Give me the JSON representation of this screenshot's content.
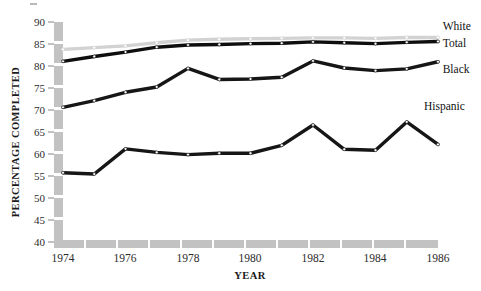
{
  "chart_data": {
    "type": "line",
    "title": "",
    "xlabel": "YEAR",
    "ylabel": "PERCENTAGE COMPLETED",
    "x": [
      1974,
      1975,
      1976,
      1977,
      1978,
      1979,
      1980,
      1981,
      1982,
      1983,
      1984,
      1985,
      1986
    ],
    "xlim": [
      1974,
      1986
    ],
    "ylim": [
      40,
      90
    ],
    "xticks": [
      1974,
      1976,
      1978,
      1980,
      1982,
      1984,
      1986
    ],
    "xtick_labels": [
      "1974",
      "1976",
      "1978",
      "1980",
      "1982",
      "1984",
      "1986"
    ],
    "yticks": [
      40,
      45,
      50,
      55,
      60,
      65,
      70,
      75,
      80,
      85,
      90
    ],
    "ytick_labels": [
      "40",
      "45",
      "50",
      "55",
      "60",
      "65",
      "70",
      "75",
      "80",
      "85",
      "90"
    ],
    "grid": false,
    "legend_position": "right-inline",
    "series": [
      {
        "name": "White",
        "color": "#d2d2d2",
        "values": [
          83.8,
          84.2,
          84.6,
          85.3,
          85.9,
          86.1,
          86.2,
          86.3,
          86.4,
          86.4,
          86.3,
          86.5,
          86.5
        ]
      },
      {
        "name": "Total",
        "color": "#0e0e0e",
        "values": [
          81.1,
          82.2,
          83.2,
          84.3,
          84.8,
          84.9,
          85.1,
          85.2,
          85.5,
          85.3,
          85.1,
          85.4,
          85.6
        ]
      },
      {
        "name": "Black",
        "color": "#161616",
        "values": [
          70.7,
          72.2,
          74.1,
          75.3,
          79.5,
          77.0,
          77.1,
          77.5,
          81.2,
          79.6,
          79.0,
          79.4,
          81.0
        ]
      },
      {
        "name": "Hispanic",
        "color": "#161616",
        "values": [
          55.9,
          55.6,
          61.3,
          60.5,
          60.0,
          60.3,
          60.3,
          62.1,
          66.7,
          61.2,
          61.0,
          67.4,
          62.3
        ]
      }
    ],
    "series_labels": [
      {
        "text": "White",
        "x": 1986.15,
        "y": 88.2
      },
      {
        "text": "Total",
        "x": 1986.15,
        "y": 84.3
      },
      {
        "text": "Black",
        "x": 1986.15,
        "y": 78.4
      },
      {
        "text": "Hispanic",
        "x": 1985.55,
        "y": 70.0
      }
    ]
  }
}
